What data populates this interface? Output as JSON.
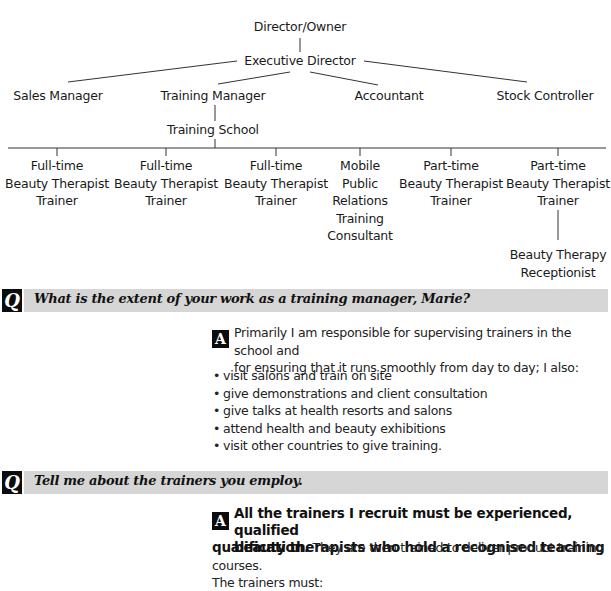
{
  "org_chart": {
    "top": "Director/Owner",
    "executive": "Executive Director",
    "managers": [
      {
        "label": "Sales Manager"
      },
      {
        "label": "Training Manager"
      },
      {
        "label": "Accountant"
      },
      {
        "label": "Stock Controller"
      }
    ],
    "training_school": "Training School",
    "staff": [
      {
        "lines": [
          "Full-time",
          "Beauty Therapist",
          "Trainer"
        ]
      },
      {
        "lines": [
          "Full-time",
          "Beauty Therapist",
          "Trainer"
        ]
      },
      {
        "lines": [
          "Full-time",
          "Beauty Therapist",
          "Trainer"
        ]
      },
      {
        "lines": [
          "Mobile",
          "Public",
          "Relations",
          "Training",
          "Consultant"
        ]
      },
      {
        "lines": [
          "Part-time",
          "Beauty Therapist",
          "Trainer"
        ]
      },
      {
        "lines": [
          "Part-time",
          "Beauty Therapist",
          "Trainer"
        ]
      }
    ],
    "receptionist": {
      "lines": [
        "Beauty Therapy",
        "Receptionist"
      ]
    }
  },
  "qa": [
    {
      "q_marker": "Q",
      "question": "What is the extent of your work as a training manager, Marie?",
      "a_marker": "A",
      "answer_lines": [
        "Primarily I am responsible for supervising trainers in the school and",
        "for ensuring that it runs smoothly from day to day; I also:"
      ],
      "bullets": [
        "visit salons and train on site",
        "give demonstrations and client consultation",
        "give talks at health resorts and salons",
        "attend health and beauty exhibitions",
        "visit other countries to give training."
      ]
    },
    {
      "q_marker": "Q",
      "question": "Tell me about the trainers you employ.",
      "a_marker": "A",
      "answer_bold_lines": [
        "All the trainers I recruit must be experienced, qualified",
        "beauty therapists who hold a recognised teaching"
      ],
      "answer_bold_tail": "qualification.",
      "answer_rest": " They are then trained to deliver product training courses.",
      "answer_last": "The trainers must:"
    }
  ],
  "colors": {
    "question_bar": "#d6d6d6",
    "marker_box": "#0c0c0c",
    "text": "#1a1a1a"
  }
}
